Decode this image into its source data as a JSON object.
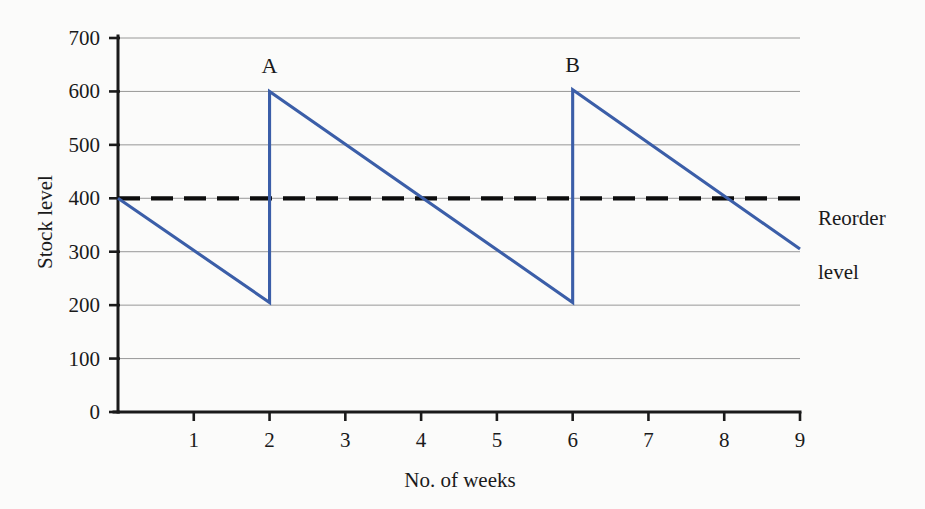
{
  "chart_data": {
    "type": "line",
    "title": "",
    "xlabel": "No. of weeks",
    "ylabel": "Stock level",
    "xlim": [
      0,
      9
    ],
    "ylim": [
      0,
      700
    ],
    "grid": true,
    "legend": "none",
    "x_ticks": [
      1,
      2,
      3,
      4,
      5,
      6,
      7,
      8,
      9
    ],
    "y_ticks": [
      0,
      100,
      200,
      300,
      400,
      500,
      600,
      700
    ],
    "series": [
      {
        "name": "Stock level",
        "color": "#3b5ea8",
        "style": "solid",
        "points": [
          [
            0,
            400
          ],
          [
            2,
            205
          ],
          [
            2,
            600
          ],
          [
            6,
            205
          ],
          [
            6,
            603
          ],
          [
            9,
            305
          ]
        ]
      },
      {
        "name": "Reorder level",
        "color": "#0d0d0d",
        "style": "dashed",
        "points": [
          [
            0,
            400
          ],
          [
            9,
            400
          ]
        ]
      }
    ],
    "annotations": [
      {
        "text": "A",
        "x": 2,
        "y": 600,
        "dy": -18
      },
      {
        "text": "B",
        "x": 6,
        "y": 603,
        "dy": -18
      }
    ],
    "threshold_label": "Reorder\nlevel"
  },
  "axis": {
    "y_title": "Stock level",
    "x_title": "No. of weeks",
    "y_tick_labels": [
      "0",
      "100",
      "200",
      "300",
      "400",
      "500",
      "600",
      "700"
    ],
    "x_tick_labels": [
      "1",
      "2",
      "3",
      "4",
      "5",
      "6",
      "7",
      "8",
      "9"
    ]
  },
  "labels": {
    "point_a": "A",
    "point_b": "B",
    "reorder_line1": "Reorder",
    "reorder_line2": "level"
  },
  "colors": {
    "series": "#3b5ea8",
    "threshold": "#0d0d0d",
    "grid": "#8c8c8c",
    "axis": "#1a1a1a",
    "background": "#fbfbfa"
  }
}
